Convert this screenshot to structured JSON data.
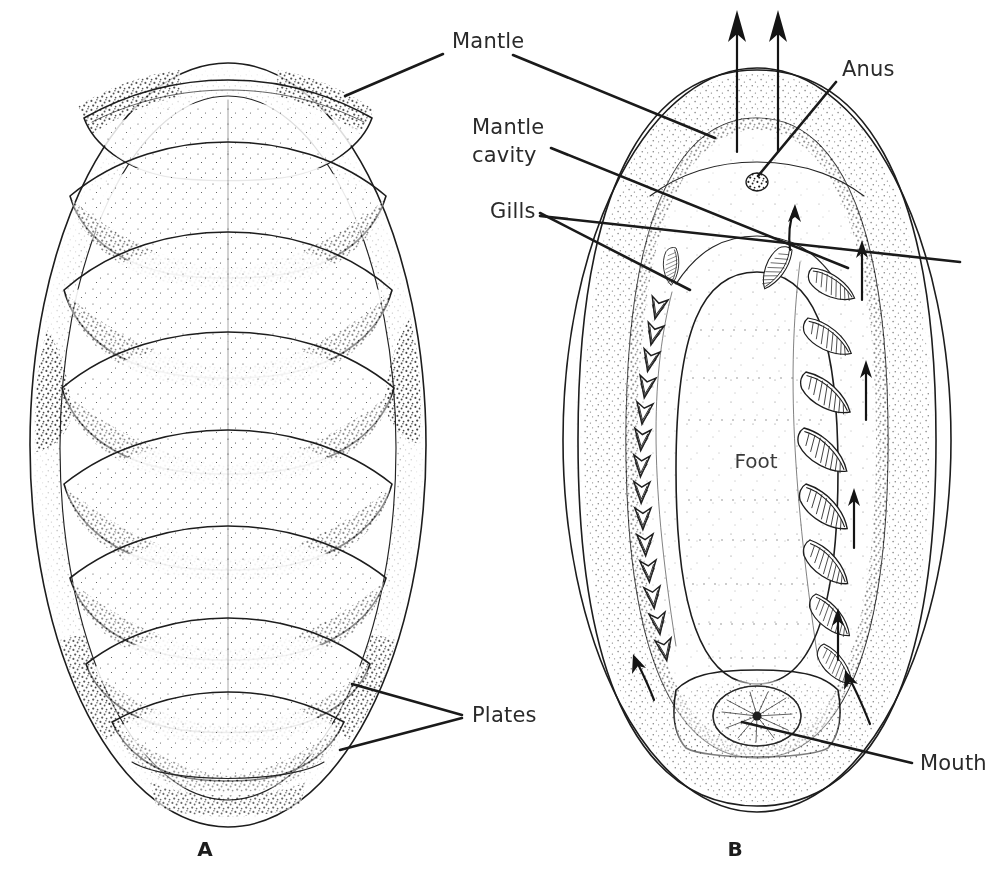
{
  "figure": {
    "background_color": "#ffffff",
    "ink_color": "#1d1d1d",
    "text_color": "#2a2a2a"
  },
  "panels": [
    {
      "letter": "A",
      "name": "dorsal-view",
      "letter_x": 205,
      "letter_y": 856,
      "plate_count": 8
    },
    {
      "letter": "B",
      "name": "ventral-view",
      "letter_x": 735,
      "letter_y": 856
    }
  ],
  "labels": [
    {
      "id": "mantle",
      "text": "Mantle",
      "x": 452,
      "y": 48,
      "anchor": "start",
      "leaders": [
        [
          [
            443,
            54
          ],
          [
            345,
            96
          ]
        ],
        [
          [
            513,
            55
          ],
          [
            715,
            138
          ]
        ]
      ]
    },
    {
      "id": "mantle-cavity",
      "text": "Mantle",
      "text2": "cavity",
      "x": 472,
      "y": 134,
      "anchor": "start",
      "leaders": [
        [
          [
            551,
            148
          ],
          [
            848,
            268
          ]
        ]
      ]
    },
    {
      "id": "gills",
      "text": "Gills",
      "x": 490,
      "y": 218,
      "anchor": "start",
      "leaders": [
        [
          [
            540,
            213
          ],
          [
            690,
            290
          ]
        ],
        [
          [
            540,
            216
          ],
          [
            960,
            262
          ]
        ]
      ]
    },
    {
      "id": "anus",
      "text": "Anus",
      "x": 842,
      "y": 76,
      "anchor": "start",
      "leaders": [
        [
          [
            836,
            82
          ],
          [
            758,
            176
          ]
        ]
      ]
    },
    {
      "id": "plates",
      "text": "Plates",
      "x": 472,
      "y": 722,
      "anchor": "start",
      "leaders": [
        [
          [
            462,
            715
          ],
          [
            352,
            684
          ]
        ],
        [
          [
            462,
            718
          ],
          [
            340,
            750
          ]
        ]
      ]
    },
    {
      "id": "mouth",
      "text": "Mouth",
      "x": 920,
      "y": 770,
      "anchor": "start",
      "leaders": [
        [
          [
            912,
            763
          ],
          [
            742,
            722
          ]
        ]
      ]
    },
    {
      "id": "foot",
      "text": "Foot",
      "x": 756,
      "y": 468,
      "anchor": "middle",
      "leaders": []
    }
  ],
  "panel_b_features": {
    "foot_label": "Foot",
    "gill_count_right": 9,
    "gill_count_left": 14,
    "exhalant_arrow_count": 2,
    "flow_arrow_count": 7
  }
}
